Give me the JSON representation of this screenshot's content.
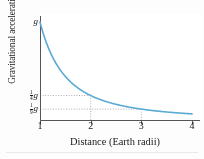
{
  "chart_data": {
    "type": "line",
    "title": "",
    "subtitle": "",
    "xlabel": "Distance (Earth radii)",
    "ylabel": "Gravitational acceleration",
    "xlim": [
      1,
      4
    ],
    "ylim": [
      0,
      1
    ],
    "grid": false,
    "legend": null,
    "x_ticks": [
      1,
      2,
      3,
      4
    ],
    "x_tick_labels": [
      "1",
      "2",
      "3",
      "4"
    ],
    "y_ticks": [
      1,
      0.25,
      0.1111
    ],
    "y_tick_labels": [
      "g",
      "1/4 g",
      "1/9 g"
    ],
    "y_tick_parts": [
      {
        "numerator": "",
        "denominator": "",
        "symbol": "g"
      },
      {
        "numerator": "1",
        "denominator": "4",
        "symbol": "g"
      },
      {
        "numerator": "1",
        "denominator": "9",
        "symbol": "g"
      }
    ],
    "series": [
      {
        "name": "Gravitational acceleration",
        "relation": "g / r^2",
        "color": "#5BA9D4",
        "x": [
          1.0,
          1.1,
          1.2,
          1.3,
          1.4,
          1.5,
          1.6,
          1.7,
          1.8,
          1.9,
          2.0,
          2.2,
          2.4,
          2.6,
          2.8,
          3.0,
          3.2,
          3.4,
          3.6,
          3.8,
          4.0
        ],
        "values": [
          1.0,
          0.826,
          0.694,
          0.592,
          0.51,
          0.444,
          0.391,
          0.346,
          0.309,
          0.277,
          0.25,
          0.207,
          0.174,
          0.148,
          0.128,
          0.111,
          0.098,
          0.087,
          0.077,
          0.069,
          0.0625
        ]
      }
    ],
    "annotations": [
      {
        "type": "guide-line",
        "style": "dotted",
        "from": [
          1,
          0.25
        ],
        "to": [
          2,
          0.25
        ]
      },
      {
        "type": "guide-line",
        "style": "dotted",
        "from": [
          2,
          0.25
        ],
        "to": [
          2,
          0
        ]
      },
      {
        "type": "guide-line",
        "style": "dotted",
        "from": [
          1,
          0.1111
        ],
        "to": [
          3,
          0.1111
        ]
      },
      {
        "type": "guide-line",
        "style": "dotted",
        "from": [
          3,
          0.1111
        ],
        "to": [
          3,
          0
        ]
      }
    ],
    "colors": {
      "curve": "#5BA9D4",
      "axis": "#555555",
      "guide": "#9a9a9a",
      "background": "#ffffff",
      "page_background": "#fdfdfd",
      "text": "#1a1a1a"
    }
  }
}
